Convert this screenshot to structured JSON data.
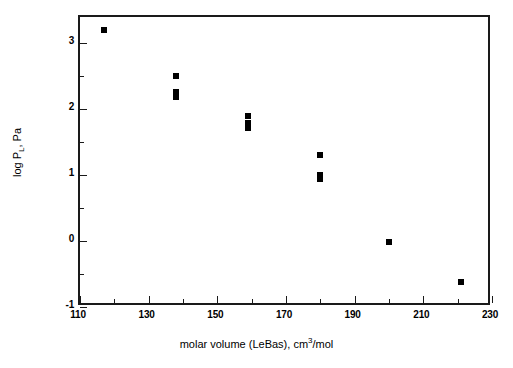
{
  "chart_data": {
    "type": "scatter",
    "title": "",
    "xlabel": "molar volume (LeBas), cm3/mol",
    "xlabel_parts": {
      "pre": "molar volume (LeBas), cm",
      "sup": "3",
      "post": "/mol"
    },
    "ylabel": "log PL, Pa",
    "ylabel_parts": {
      "pre": "log P",
      "sub": "L",
      "post": ", Pa"
    },
    "xlim": [
      110,
      230
    ],
    "ylim": [
      -1,
      3.4
    ],
    "xticks": [
      110,
      130,
      150,
      170,
      190,
      210,
      230
    ],
    "xtick_labels": [
      "110",
      "130",
      "150",
      "170",
      "190",
      "210",
      "230"
    ],
    "xminor_ticks": [
      120,
      140,
      160,
      180,
      200,
      220
    ],
    "yticks": [
      -1,
      0,
      1,
      2,
      3
    ],
    "ytick_labels": [
      "-1",
      "0",
      "1",
      "2",
      "3"
    ],
    "yminor_ticks": [
      -0.5,
      0.5,
      1.5,
      2.5,
      3.5
    ],
    "grid": false,
    "legend": null,
    "marker": "square",
    "marker_color": "#000000",
    "marker_size": 6,
    "points": [
      {
        "x": 117,
        "y": 3.2
      },
      {
        "x": 138,
        "y": 2.5
      },
      {
        "x": 138,
        "y": 2.26
      },
      {
        "x": 138,
        "y": 2.19
      },
      {
        "x": 159,
        "y": 1.9
      },
      {
        "x": 159,
        "y": 1.79
      },
      {
        "x": 159,
        "y": 1.72
      },
      {
        "x": 180,
        "y": 1.3
      },
      {
        "x": 180,
        "y": 1.01
      },
      {
        "x": 180,
        "y": 0.94
      },
      {
        "x": 200,
        "y": -0.01
      },
      {
        "x": 221,
        "y": -0.62
      }
    ]
  }
}
